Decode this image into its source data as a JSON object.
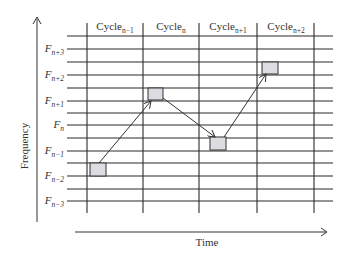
{
  "diagram": {
    "type": "frequency-hopping-grid",
    "y_axis_label": "Frequency",
    "x_axis_label": "Time",
    "columns": [
      {
        "base": "Cycle",
        "sub": "n−1"
      },
      {
        "base": "Cycle",
        "sub": "n"
      },
      {
        "base": "Cycle",
        "sub": "n+1"
      },
      {
        "base": "Cycle",
        "sub": "n+2"
      }
    ],
    "rows": [
      {
        "base": "F",
        "sub": "n+3"
      },
      {
        "base": "F",
        "sub": "n+2"
      },
      {
        "base": "F",
        "sub": "n+1"
      },
      {
        "base": "F",
        "sub": "n"
      },
      {
        "base": "F",
        "sub": "n−1"
      },
      {
        "base": "F",
        "sub": "n−2"
      },
      {
        "base": "F",
        "sub": "n−3"
      }
    ],
    "hops": [
      {
        "cycle": "Cycle n−1",
        "frequency": "F n−2"
      },
      {
        "cycle": "Cycle n",
        "frequency": "F n+1"
      },
      {
        "cycle": "Cycle n+1",
        "frequency": "F n−1"
      },
      {
        "cycle": "Cycle n+2",
        "frequency": "F n+2"
      }
    ],
    "colors": {
      "grid": "#222222",
      "box_fill": "#dcdde3",
      "box_stroke": "#333333",
      "arrow": "#333333"
    }
  }
}
